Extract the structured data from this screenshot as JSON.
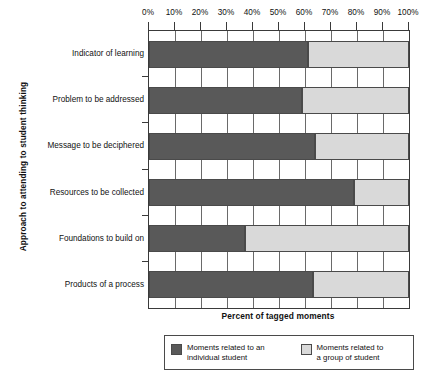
{
  "chart_data": {
    "type": "bar",
    "orientation": "horizontal",
    "stacked": true,
    "normalized": true,
    "title": "",
    "xlabel": "Percent of tagged moments",
    "ylabel": "Approach to attending to student thinking",
    "xlim": [
      0,
      100
    ],
    "grid": true,
    "legend_position": "bottom",
    "xtick_labels": [
      "0%",
      "10%",
      "20%",
      "30%",
      "40%",
      "50%",
      "60%",
      "70%",
      "80%",
      "90%",
      "100%"
    ],
    "xtick_values": [
      0,
      10,
      20,
      30,
      40,
      50,
      60,
      70,
      80,
      90,
      100
    ],
    "categories": [
      "Indicator of learning",
      "Problem to be addressed",
      "Message to be deciphered",
      "Resources to be collected",
      "Foundations to build on",
      "Products of a process"
    ],
    "series": [
      {
        "name": "Moments related to an individual student",
        "color": "#595959",
        "values": [
          61,
          59,
          64,
          79,
          37,
          63
        ]
      },
      {
        "name": "Moments related to a group of student",
        "color": "#d9d9d9",
        "values": [
          39,
          41,
          36,
          21,
          63,
          37
        ]
      }
    ]
  },
  "axes": {
    "y_title": "Approach to attending to student thinking",
    "x_title": "Percent of tagged moments"
  },
  "legend": {
    "entries": [
      {
        "label": "Moments related to an\nindividual student",
        "swatch": "dark"
      },
      {
        "label": "Moments related to\na group of student",
        "swatch": "light"
      }
    ]
  },
  "colors": {
    "individual": "#595959",
    "group": "#d9d9d9",
    "axis": "#3a3a3a",
    "grid": "#6a6a6a",
    "background": "#ffffff"
  }
}
